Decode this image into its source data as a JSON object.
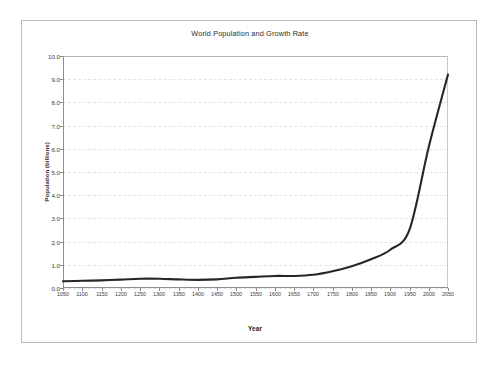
{
  "chart_data": {
    "type": "line",
    "title": "World Population and Growth Rate",
    "xlabel": "Year",
    "ylabel": "Population (billions)",
    "xlim": [
      1050,
      2050
    ],
    "ylim": [
      0.0,
      10.0
    ],
    "grid": true,
    "legend": "none",
    "line_color": "#262626",
    "x_ticks": [
      1050,
      1100,
      1150,
      1200,
      1250,
      1300,
      1350,
      1400,
      1450,
      1500,
      1550,
      1600,
      1650,
      1700,
      1750,
      1800,
      1850,
      1900,
      1950,
      2000,
      2050
    ],
    "x_tick_labels": [
      "1050",
      "1100",
      "1150",
      "1200",
      "1250",
      "1300",
      "1350",
      "1400",
      "1450",
      "1500",
      "1550",
      "1600",
      "1650",
      "1700",
      "1750",
      "1800",
      "1850",
      "1900",
      "1950",
      "2000",
      "2050"
    ],
    "y_ticks": [
      0.0,
      1.0,
      2.0,
      3.0,
      4.0,
      5.0,
      6.0,
      7.0,
      8.0,
      9.0,
      10.0
    ],
    "y_tick_labels": [
      "0.0",
      "1.0",
      "2.0",
      "3.0",
      "4.0",
      "5.0",
      "6.0",
      "7.0",
      "8.0",
      "9.0",
      "10.0"
    ],
    "series": [
      {
        "name": "World Population",
        "x": [
          1050,
          1100,
          1150,
          1200,
          1250,
          1300,
          1350,
          1400,
          1450,
          1500,
          1550,
          1600,
          1650,
          1700,
          1750,
          1800,
          1850,
          1900,
          1950,
          2000,
          2050
        ],
        "values": [
          0.29,
          0.31,
          0.33,
          0.36,
          0.4,
          0.4,
          0.37,
          0.35,
          0.37,
          0.44,
          0.48,
          0.52,
          0.52,
          0.57,
          0.72,
          0.94,
          1.24,
          1.65,
          2.52,
          6.08,
          9.2
        ]
      }
    ]
  },
  "figure": {
    "border_color": "#b9b9b9",
    "background": "#ffffff"
  }
}
